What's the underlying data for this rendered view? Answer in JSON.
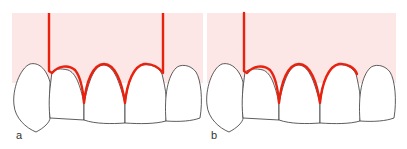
{
  "figure": {
    "panels": [
      {
        "label": "a",
        "description": "incision line with two vertical releasing incisions and three interdental papillae scalloped"
      },
      {
        "label": "b",
        "description": "incision line with one vertical releasing incision and scalloped papillae"
      }
    ],
    "colors": {
      "gingiva_fill": "#fde6e6",
      "incision_line": "#e8220e",
      "tooth_outline": "#333333",
      "tooth_fill": "#ffffff"
    }
  }
}
